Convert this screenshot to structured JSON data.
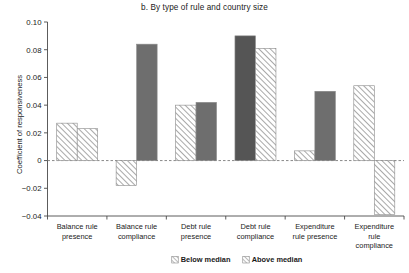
{
  "chart_data": {
    "type": "bar",
    "title": "b. By type of rule and country size",
    "xlabel": "",
    "ylabel": "Coefficient of responsiveness",
    "ylim": [
      -0.04,
      0.1
    ],
    "yticks": [
      -0.04,
      -0.02,
      0,
      0.02,
      0.04,
      0.06,
      0.08,
      0.1
    ],
    "ytick_labels": [
      "-0.04",
      "-0.02",
      "0",
      "0.02",
      "0.04",
      "0.06",
      "0.08",
      "0.10"
    ],
    "grid": false,
    "legend_position": "bottom-center",
    "zero_reference_line": true,
    "categories": [
      "Balance rule presence",
      "Balance rule compliance",
      "Debt rule presence",
      "Debt rule compliance",
      "Expenditure rule presence",
      "Expenditure rule compliance"
    ],
    "category_label_lines": [
      [
        "Balance rule",
        "presence"
      ],
      [
        "Balance rule",
        "compliance"
      ],
      [
        "Debt rule",
        "presence"
      ],
      [
        "Debt rule",
        "compliance"
      ],
      [
        "Expenditure",
        "rule presence"
      ],
      [
        "Expenditure",
        "rule",
        "compliance"
      ]
    ],
    "series": [
      {
        "name": "Below median",
        "style": "hatched",
        "values": [
          0.027,
          -0.018,
          0.04,
          0.09,
          0.007,
          0.054
        ],
        "fills": [
          "hatch",
          "hatch",
          "hatch",
          "solid-dark",
          "hatch",
          "hatch"
        ]
      },
      {
        "name": "Above median",
        "style": "hatched",
        "values": [
          0.023,
          0.084,
          0.042,
          0.081,
          0.05,
          -0.039
        ],
        "fills": [
          "hatch",
          "solid-gray",
          "solid-gray",
          "hatch",
          "solid-gray",
          "hatch"
        ]
      }
    ]
  },
  "legend": {
    "items": [
      {
        "label": "Below median",
        "swatch": "hatch"
      },
      {
        "label": "Above median",
        "swatch": "hatch"
      }
    ]
  },
  "colors": {
    "hatch_line": "#8d8d8d",
    "hatch_background": "#ffffff",
    "solid_gray": "#6e6e6e",
    "solid_dark": "#555555",
    "axis": "#4a4a4a",
    "text": "#1a1a1a",
    "zero_line": "#7a7a7a",
    "background": "#ffffff"
  }
}
